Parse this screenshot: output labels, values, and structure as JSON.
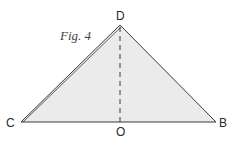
{
  "figure": {
    "caption": "Fig. 4",
    "fill_color": "#ebebeb",
    "stroke_color": "#3a3a3a",
    "points": {
      "D": {
        "label": "D",
        "x": 120,
        "y": 25
      },
      "C": {
        "label": "C",
        "x": 21,
        "y": 122
      },
      "B": {
        "label": "B",
        "x": 216,
        "y": 122
      },
      "O": {
        "label": "O",
        "x": 120,
        "y": 122
      }
    },
    "segments": [
      {
        "from": "C",
        "to": "D",
        "style": "solid-double"
      },
      {
        "from": "D",
        "to": "B",
        "style": "solid"
      },
      {
        "from": "C",
        "to": "B",
        "style": "solid"
      },
      {
        "from": "D",
        "to": "O",
        "style": "dashed"
      }
    ]
  }
}
